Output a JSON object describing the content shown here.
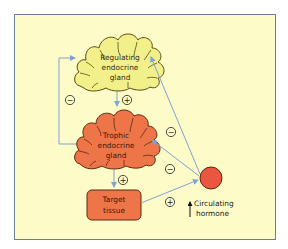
{
  "diagram": {
    "colors": {
      "background_panel": "#fdfbc8",
      "panel_border": "#6b7f99",
      "regulating_gland_fill": "#f2f08a",
      "trophic_gland_fill": "#ee7548",
      "target_tissue_fill": "#ee7548",
      "hormone_circle_fill": "#e8573e",
      "arrow": "#7fa3d6"
    },
    "nodes": {
      "regulating_gland": {
        "label_lines": [
          "Regulating",
          "endocrine",
          "gland"
        ]
      },
      "trophic_gland": {
        "label_lines": [
          "Trophic",
          "endocrine",
          "gland"
        ]
      },
      "target_tissue": {
        "label_lines": [
          "Target",
          "tissue"
        ]
      },
      "circulating_hormone": {
        "label_lines": [
          "Circulating",
          "hormone"
        ],
        "indicator": "↑"
      }
    },
    "edges": [
      {
        "from": "regulating_gland",
        "to": "trophic_gland",
        "sign": "+"
      },
      {
        "from": "trophic_gland",
        "to": "target_tissue",
        "sign": "+"
      },
      {
        "from": "target_tissue",
        "to": "circulating_hormone",
        "sign": "+"
      },
      {
        "from": "circulating_hormone",
        "to": "regulating_gland",
        "sign": "−"
      },
      {
        "from": "circulating_hormone",
        "to": "trophic_gland",
        "sign": "−"
      },
      {
        "from": "trophic_gland",
        "to": "regulating_gland",
        "sign": "−",
        "style": "bracket-loop-left"
      }
    ],
    "signs": {
      "reg_to_troph": "+",
      "troph_to_target": "+",
      "target_to_hormone": "+",
      "hormone_to_reg": "−",
      "hormone_to_troph": "−",
      "troph_loop_to_reg": "−"
    }
  }
}
